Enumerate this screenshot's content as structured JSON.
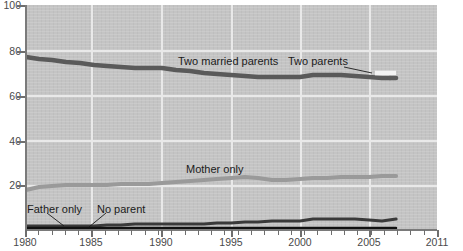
{
  "chart_data": {
    "type": "line",
    "title": "",
    "subtitle": "",
    "xlabel": "",
    "ylabel": "",
    "xlim": [
      1980,
      2011
    ],
    "ylim": [
      0,
      100
    ],
    "grid": true,
    "legend_position": "inline-annotations",
    "x_ticks_major": [
      "1980",
      "1985",
      "1990",
      "1995",
      "2000",
      "2005",
      "2011"
    ],
    "y_ticks": [
      "0",
      "20",
      "40",
      "60",
      "80",
      "100"
    ],
    "y_tick_labels_shown": [
      "20",
      "40",
      "60",
      "80",
      "100"
    ],
    "x": [
      1980,
      1981,
      1982,
      1983,
      1984,
      1985,
      1986,
      1987,
      1988,
      1989,
      1990,
      1991,
      1992,
      1993,
      1994,
      1995,
      1996,
      1997,
      1998,
      1999,
      2000,
      2001,
      2002,
      2003,
      2004,
      2005,
      2006,
      2007
    ],
    "series": [
      {
        "name": "Two married parents",
        "color": "#5a5a5a",
        "label": "Two married parents",
        "values": [
          77,
          76.5,
          76,
          75.5,
          75,
          74.5,
          74,
          73.5,
          73,
          73,
          73,
          72.5,
          72,
          71.5,
          71,
          70.5,
          70,
          69.5,
          69.5,
          69.5,
          69.5,
          70,
          70,
          70,
          69.5,
          69,
          68.5,
          68
        ]
      },
      {
        "name": "Two parents",
        "color": "#ffffff",
        "label": "Two parents",
        "values": [
          null,
          null,
          null,
          null,
          null,
          null,
          null,
          null,
          null,
          null,
          null,
          null,
          null,
          null,
          null,
          null,
          null,
          null,
          null,
          null,
          null,
          null,
          null,
          null,
          null,
          null,
          69.5,
          69.5
        ]
      },
      {
        "name": "Mother only",
        "color": "#9a9a9a",
        "label": "Mother only",
        "values": [
          18,
          19,
          19.5,
          20,
          20,
          20,
          20,
          20.2,
          20.5,
          20.5,
          20.7,
          21,
          21.5,
          22,
          22.5,
          23,
          23.5,
          23,
          22.5,
          22.2,
          22.5,
          23,
          23,
          23.2,
          23.3,
          23.4,
          23.5,
          23.5
        ]
      },
      {
        "name": "Father only",
        "color": "#3a3a3a",
        "label": "Father only",
        "values": [
          2,
          2,
          2,
          2,
          2,
          2,
          2.5,
          2.5,
          3,
          3,
          3,
          3,
          3,
          3,
          3.2,
          3.4,
          3.5,
          3.7,
          4,
          4,
          4.2,
          4.6,
          4.7,
          4.7,
          4.7,
          4.4,
          4,
          4.6
        ]
      },
      {
        "name": "No parent",
        "color": "#111111",
        "label": "No parent",
        "values": [
          1,
          1,
          1,
          1,
          1,
          1,
          1,
          1,
          1,
          1,
          1,
          1,
          1,
          1,
          1,
          1,
          1,
          1,
          1,
          1,
          1,
          1,
          1,
          1,
          1,
          1,
          1,
          1
        ]
      }
    ],
    "annotations": [
      {
        "text": "Two married parents",
        "x": 1993,
        "y": 85
      },
      {
        "text": "Two parents",
        "x": 2003,
        "y": 84
      },
      {
        "text": "Mother only",
        "x": 1994,
        "y": 31
      },
      {
        "text": "Father only",
        "x": 1981,
        "y": 12
      },
      {
        "text": "No parent",
        "x": 1986,
        "y": 12
      }
    ],
    "colors": {
      "plot_background": "#c2c2c2",
      "gridline": "#e9e9e9",
      "axis": "#7a7a7a",
      "page_background": "#ffffff",
      "text": "#4a4a4a"
    }
  },
  "axis": {
    "y": {
      "t100": "100",
      "t80": "80",
      "t60": "60",
      "t40": "40",
      "t20": "20"
    },
    "x": {
      "t1980": "1980",
      "t1985": "1985",
      "t1990": "1990",
      "t1995": "1995",
      "t2000": "2000",
      "t2005": "2005",
      "t2011": "2011"
    }
  },
  "labels": {
    "two_married_parents": "Two married parents",
    "two_parents": "Two parents",
    "mother_only": "Mother only",
    "father_only": "Father only",
    "no_parent": "No parent"
  }
}
